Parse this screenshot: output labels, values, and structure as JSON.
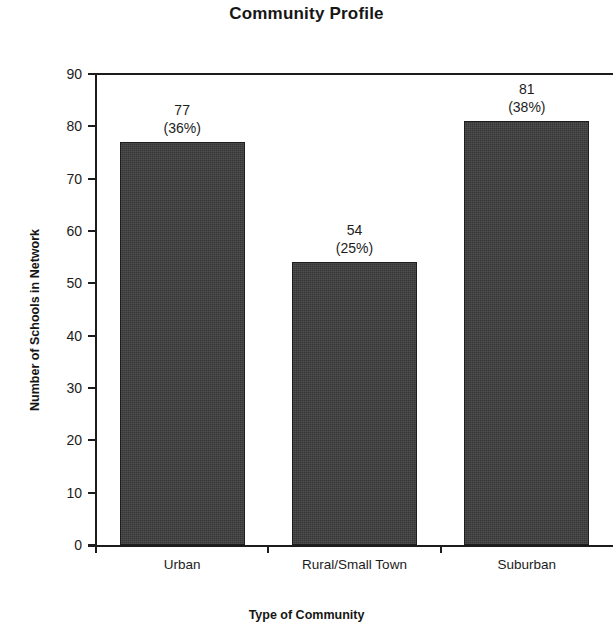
{
  "chart_data": {
    "type": "bar",
    "title": "Community Profile",
    "xlabel": "Type of Community",
    "ylabel": "Number of Schools in Network",
    "categories": [
      "Urban",
      "Rural/Small Town",
      "Suburban"
    ],
    "values": [
      77,
      54,
      81
    ],
    "percent_labels": [
      "(36%)",
      "(25%)",
      "(38%)"
    ],
    "percents": [
      36,
      25,
      38
    ],
    "value_labels": [
      "77",
      "54",
      "81"
    ],
    "ylim": [
      0,
      90
    ],
    "ytick_labels": [
      "90",
      "80",
      "70",
      "60",
      "50",
      "40",
      "30",
      "20",
      "10",
      "0"
    ],
    "yticks": [
      90,
      80,
      70,
      60,
      50,
      40,
      30,
      20,
      10,
      0
    ],
    "grid": false,
    "legend": null,
    "bar_color": "#3c3c3c",
    "bar_edge_color": "#1e1e1e",
    "axis_color": "#1c1c1c",
    "background": "#ffffff"
  }
}
